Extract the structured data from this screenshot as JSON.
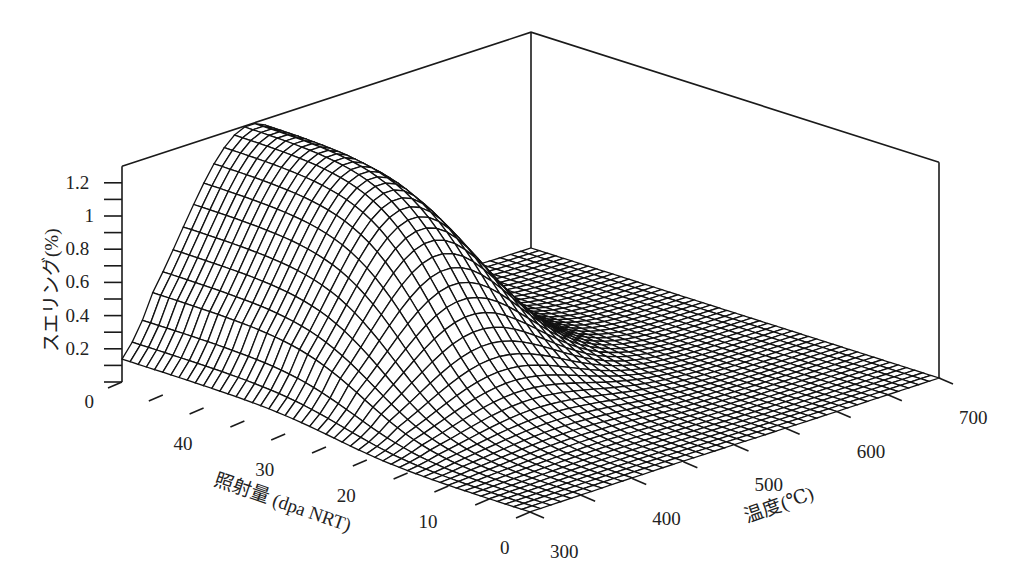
{
  "chart_data": {
    "type": "surface3d",
    "title": "",
    "zlabel": "スエリング(%)",
    "xlabel": "照射量 (dpa NRT)",
    "ylabel": "温度(℃)",
    "z_ticks": [
      "0",
      "0.2",
      "0.4",
      "0.6",
      "0.8",
      "1",
      "1.2"
    ],
    "dose_ticks": [
      "0",
      "10",
      "20",
      "30",
      "40"
    ],
    "temp_ticks": [
      "300",
      "400",
      "500",
      "600",
      "700"
    ],
    "zlim": [
      0,
      1.3
    ],
    "dose_range": [
      0,
      50
    ],
    "temp_range": [
      300,
      700
    ],
    "grid": true,
    "legend": "none",
    "peak": {
      "dose_dpa": 50,
      "temp_c": 420,
      "swelling_pct": 1.28
    },
    "sample_values": {
      "temps_c": [
        300,
        350,
        400,
        450,
        500,
        550,
        600,
        650,
        700
      ],
      "doses_dpa": [
        0,
        10,
        20,
        30,
        40,
        50
      ],
      "swelling_pct": [
        [
          0.0,
          0.0,
          0.0,
          0.0,
          0.0,
          0.0,
          0.0,
          0.0,
          0.0
        ],
        [
          0.01,
          0.02,
          0.03,
          0.02,
          0.01,
          0.0,
          0.0,
          0.0,
          0.0
        ],
        [
          0.1,
          0.2,
          0.26,
          0.22,
          0.12,
          0.04,
          0.01,
          0.0,
          0.0
        ],
        [
          0.4,
          0.75,
          0.9,
          0.78,
          0.45,
          0.18,
          0.05,
          0.01,
          0.0
        ],
        [
          0.6,
          1.05,
          1.22,
          1.08,
          0.65,
          0.26,
          0.07,
          0.01,
          0.0
        ],
        [
          0.65,
          1.12,
          1.28,
          1.14,
          0.7,
          0.28,
          0.08,
          0.02,
          0.0
        ]
      ]
    }
  },
  "axes": {
    "z_title": "スエリング(%)",
    "dose_title": "照射量 (dpa NRT)",
    "temp_title": "温度(℃)"
  }
}
